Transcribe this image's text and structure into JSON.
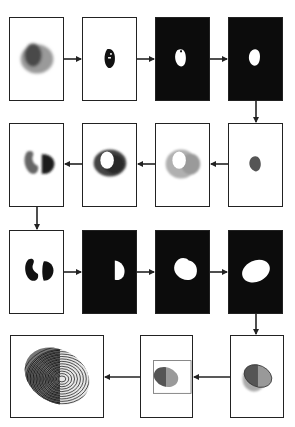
{
  "diagram": {
    "type": "image-processing-pipeline",
    "colors": {
      "frame": "#222222",
      "dark_background": "#0c0c0c",
      "arrow": "#222222",
      "light_region": "#9a9a9a",
      "dark_region": "#3e3e3e",
      "mask_white": "#ffffff"
    },
    "steps": [
      {
        "id": 1,
        "row": 1,
        "description": "input fingerprint blob (two-tone)"
      },
      {
        "id": 2,
        "row": 1,
        "description": "dark core extraction"
      },
      {
        "id": 3,
        "row": 1,
        "description": "binary mask (white on black)"
      },
      {
        "id": 4,
        "row": 1,
        "description": "cleaned binary mask"
      },
      {
        "id": 5,
        "row": 2,
        "description": "grey region of mask"
      },
      {
        "id": 6,
        "row": 2,
        "description": "light ring with hole"
      },
      {
        "id": 7,
        "row": 2,
        "description": "dark ring with hole"
      },
      {
        "id": 8,
        "row": 2,
        "description": "split halves"
      },
      {
        "id": 9,
        "row": 3,
        "description": "black split halves"
      },
      {
        "id": 10,
        "row": 3,
        "description": "half mask white on black"
      },
      {
        "id": 11,
        "row": 3,
        "description": "merged mask"
      },
      {
        "id": 12,
        "row": 3,
        "description": "ellipse fit"
      },
      {
        "id": 13,
        "row": 4,
        "description": "ellipse overlay on fingerprint"
      },
      {
        "id": 14,
        "row": 4,
        "description": "cropped bounding box"
      },
      {
        "id": 15,
        "row": 4,
        "description": "final fingerprint output"
      }
    ],
    "flow": "row1 left-to-right, down, row2 right-to-left, down, row3 left-to-right, down, row4 right-to-left"
  }
}
